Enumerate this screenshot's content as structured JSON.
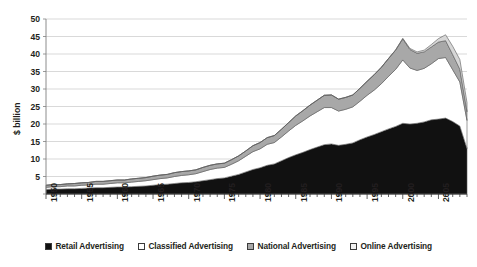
{
  "chart_data": {
    "type": "area",
    "title": "",
    "subtitle": "",
    "xlabel": "",
    "ylabel": "$ billion",
    "stacked": true,
    "grid": true,
    "legend_position": "bottom",
    "xlim": [
      1950,
      2009
    ],
    "ylim": [
      0,
      50
    ],
    "ytick_values": [
      0,
      5,
      10,
      15,
      20,
      25,
      30,
      35,
      40,
      45,
      50
    ],
    "ytick_labels": [
      "0",
      "5",
      "10",
      "15",
      "20",
      "25",
      "30",
      "35",
      "40",
      "45",
      "50"
    ],
    "xtick_labels": [
      "1950",
      "1955",
      "1960",
      "1965",
      "1970",
      "1975",
      "1980",
      "1985",
      "1990",
      "1995",
      "2000",
      "2005"
    ],
    "xtick_values": [
      1950,
      1955,
      1960,
      1965,
      1970,
      1975,
      1980,
      1985,
      1990,
      1995,
      2000,
      2005
    ],
    "x": [
      1950,
      1951,
      1952,
      1953,
      1954,
      1955,
      1956,
      1957,
      1958,
      1959,
      1960,
      1961,
      1962,
      1963,
      1964,
      1965,
      1966,
      1967,
      1968,
      1969,
      1970,
      1971,
      1972,
      1973,
      1974,
      1975,
      1976,
      1977,
      1978,
      1979,
      1980,
      1981,
      1982,
      1983,
      1984,
      1985,
      1986,
      1987,
      1988,
      1989,
      1990,
      1991,
      1992,
      1993,
      1994,
      1995,
      1996,
      1997,
      1998,
      1999,
      2000,
      2001,
      2002,
      2003,
      2004,
      2005,
      2006,
      2007,
      2008,
      2009
    ],
    "series": [
      {
        "name": "Retail Advertising",
        "color": "#111111",
        "values": [
          1.3,
          1.4,
          1.4,
          1.5,
          1.5,
          1.6,
          1.7,
          1.8,
          1.8,
          1.9,
          2.0,
          2.0,
          2.1,
          2.2,
          2.3,
          2.5,
          2.7,
          2.8,
          3.0,
          3.2,
          3.3,
          3.5,
          3.8,
          4.1,
          4.4,
          4.6,
          5.1,
          5.6,
          6.3,
          7.0,
          7.5,
          8.2,
          8.6,
          9.5,
          10.4,
          11.2,
          11.9,
          12.7,
          13.4,
          14.1,
          14.3,
          13.9,
          14.2,
          14.6,
          15.5,
          16.3,
          17.0,
          17.8,
          18.6,
          19.3,
          20.2,
          20.0,
          20.2,
          20.6,
          21.2,
          21.4,
          21.7,
          20.7,
          19.4,
          13.0
        ]
      },
      {
        "name": "Classified Advertising",
        "color": "#ffffff",
        "values": [
          0.6,
          0.7,
          0.7,
          0.8,
          0.8,
          0.9,
          0.9,
          1.0,
          1.0,
          1.1,
          1.2,
          1.2,
          1.3,
          1.4,
          1.5,
          1.6,
          1.7,
          1.8,
          2.0,
          2.1,
          2.2,
          2.3,
          2.6,
          2.9,
          3.0,
          3.0,
          3.4,
          3.9,
          4.5,
          5.1,
          5.4,
          6.0,
          6.1,
          6.8,
          7.6,
          8.4,
          9.0,
          9.6,
          10.1,
          10.6,
          10.4,
          9.8,
          10.0,
          10.3,
          11.0,
          11.9,
          12.7,
          13.7,
          15.0,
          16.3,
          18.1,
          16.0,
          15.1,
          15.3,
          16.0,
          17.3,
          17.3,
          14.8,
          12.6,
          8.0
        ]
      },
      {
        "name": "National Advertising",
        "color": "#a8a8a8",
        "values": [
          0.6,
          0.6,
          0.6,
          0.6,
          0.7,
          0.7,
          0.7,
          0.8,
          0.8,
          0.8,
          0.8,
          0.8,
          0.9,
          0.9,
          0.9,
          1.0,
          1.0,
          1.0,
          1.1,
          1.1,
          1.1,
          1.1,
          1.2,
          1.2,
          1.2,
          1.2,
          1.3,
          1.4,
          1.5,
          1.7,
          1.8,
          1.9,
          2.0,
          2.2,
          2.4,
          2.7,
          2.9,
          3.1,
          3.3,
          3.5,
          3.6,
          3.4,
          3.4,
          3.4,
          3.7,
          4.0,
          4.4,
          4.7,
          5.1,
          5.5,
          6.0,
          5.3,
          4.9,
          4.7,
          4.8,
          4.7,
          4.8,
          4.3,
          3.6,
          2.5
        ]
      },
      {
        "name": "Online Advertising",
        "color": "#d6d6d6",
        "values": [
          0,
          0,
          0,
          0,
          0,
          0,
          0,
          0,
          0,
          0,
          0,
          0,
          0,
          0,
          0,
          0,
          0,
          0,
          0,
          0,
          0,
          0,
          0,
          0,
          0,
          0,
          0,
          0,
          0,
          0,
          0,
          0,
          0,
          0,
          0,
          0,
          0,
          0,
          0,
          0,
          0,
          0,
          0,
          0,
          0,
          0,
          0,
          0,
          0,
          0.1,
          0.2,
          0.3,
          0.4,
          0.5,
          0.7,
          1.0,
          1.7,
          2.4,
          2.8,
          2.6
        ]
      }
    ]
  },
  "legend": {
    "items": [
      {
        "label": "Retail Advertising",
        "color": "#111111"
      },
      {
        "label": "Classified Advertising",
        "color": "#ffffff"
      },
      {
        "label": "National Advertising",
        "color": "#a8a8a8"
      },
      {
        "label": "Online Advertising",
        "color": "#f2f2f2"
      }
    ]
  },
  "axis": {
    "y_title": "$ billion"
  }
}
